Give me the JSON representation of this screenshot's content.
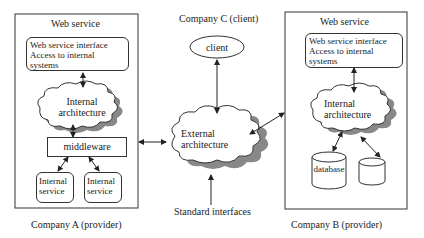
{
  "company_a": {
    "caption": "Company A (provider)",
    "web_service_title": "Web service",
    "interface_box": [
      "Web service interface",
      "Access to internal",
      "systems"
    ],
    "cloud_label": [
      "Internal",
      "architecture"
    ],
    "middleware": "middleware",
    "services": [
      [
        "Internal",
        "service"
      ],
      [
        "Internal",
        "service"
      ]
    ]
  },
  "company_b": {
    "caption": "Company B (provider)",
    "web_service_title": "Web service",
    "interface_box": [
      "Web service interface",
      "Access to internal",
      "systems"
    ],
    "cloud_label": [
      "Internal",
      "architecture"
    ],
    "databases": [
      "database",
      ""
    ]
  },
  "company_c": {
    "caption": "Company C (client)",
    "client": "client"
  },
  "external": {
    "cloud_label": [
      "External",
      "architecture"
    ],
    "standard_interfaces": "Standard interfaces"
  }
}
